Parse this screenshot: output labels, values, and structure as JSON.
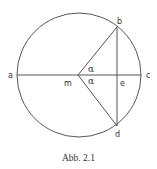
{
  "figure": {
    "caption": "Abb. 2.1",
    "stroke_color": "#555555",
    "text_color": "#333333"
  },
  "diagram": {
    "type": "geometry",
    "circle": {
      "center": "m",
      "cx": 79,
      "cy": 75,
      "r": 62
    },
    "points": {
      "a": {
        "label": "a",
        "x": 17,
        "y": 75
      },
      "c": {
        "label": "c",
        "x": 141,
        "y": 75
      },
      "m": {
        "label": "m",
        "x": 78,
        "y": 75
      },
      "b": {
        "label": "b",
        "x": 117,
        "y": 27
      },
      "d": {
        "label": "d",
        "x": 117,
        "y": 126
      },
      "e": {
        "label": "e",
        "x": 117,
        "y": 75
      }
    },
    "segments": [
      [
        "a",
        "c"
      ],
      [
        "m",
        "b"
      ],
      [
        "m",
        "d"
      ],
      [
        "b",
        "d"
      ]
    ],
    "angles": [
      {
        "label": "α",
        "vertex": "m",
        "between": [
          "b",
          "c"
        ]
      },
      {
        "label": "α",
        "vertex": "m",
        "between": [
          "c",
          "d"
        ]
      }
    ]
  }
}
